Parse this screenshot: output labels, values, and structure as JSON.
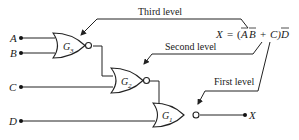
{
  "diagram": {
    "type": "logic-circuit",
    "inputs": [
      {
        "label": "A"
      },
      {
        "label": "B"
      },
      {
        "label": "C"
      },
      {
        "label": "D"
      }
    ],
    "gates": [
      {
        "label": "G",
        "sub": "3",
        "kind": "NOR"
      },
      {
        "label": "G",
        "sub": "2",
        "kind": "NOR"
      },
      {
        "label": "G",
        "sub": "1",
        "kind": "NOR"
      }
    ],
    "output": {
      "label": "X"
    },
    "annotations": {
      "third_level": "Third level",
      "second_level": "Second level",
      "first_level": "First level"
    },
    "equation": {
      "lhs": "X",
      "eq": "=",
      "open": "(",
      "a": "A",
      "b": "B",
      "plus": "+",
      "c": "C)",
      "d": "D"
    }
  }
}
